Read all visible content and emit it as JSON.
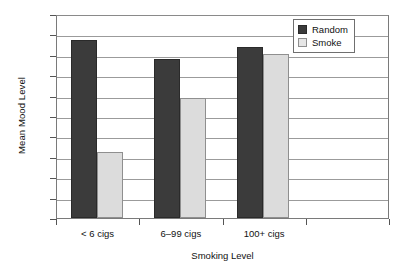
{
  "chart_data": {
    "type": "bar",
    "title": "",
    "xlabel": "Smoking Level",
    "ylabel": "Mean Mood Level",
    "categories": [
      "< 6 cigs",
      "6–99 cigs",
      "100+ cigs"
    ],
    "series": [
      {
        "name": "Random",
        "color": "#3b3b3b",
        "values": [
          6.75,
          6.56,
          6.68
        ]
      },
      {
        "name": "Smoke",
        "color": "#dcdcdc",
        "values": [
          5.65,
          6.18,
          6.61
        ]
      }
    ],
    "ylim": [
      5,
      7
    ],
    "ytick_labels": [
      "5",
      "5.2",
      "5.4",
      "5.6",
      "5.8",
      "6",
      "6.2",
      "6.4",
      "6.6",
      "6.8",
      "7"
    ],
    "ytick_values": [
      5,
      5.2,
      5.4,
      5.6,
      5.8,
      6,
      6.2,
      6.4,
      6.6,
      6.8,
      7
    ],
    "grid": true,
    "legend_position": "top-right",
    "legend_entries": [
      "Random",
      "Smoke"
    ]
  }
}
